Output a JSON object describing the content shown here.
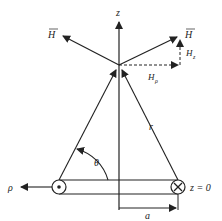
{
  "diagram": {
    "labels": {
      "z_axis": "z",
      "H_left": "H",
      "H_right": "H",
      "H_z": "H",
      "H_z_sub": "z",
      "H_rho": "H",
      "H_rho_sub": "ρ",
      "r": "r",
      "theta": "θ",
      "rho": "ρ",
      "z0": "z = 0",
      "a": "a"
    },
    "symbols": {
      "left_current": "dot (out of page)",
      "right_current": "cross (into page)"
    },
    "colors": {
      "stroke": "#222222",
      "background": "#ffffff"
    }
  }
}
